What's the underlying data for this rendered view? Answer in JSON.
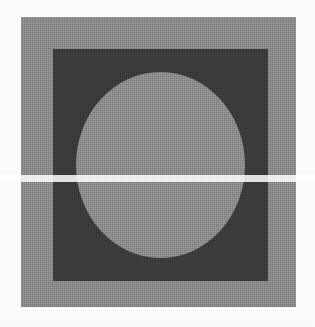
{
  "figure": {
    "caption": "",
    "media": "scanned halftone print",
    "canvas": {
      "width": 315,
      "height": 327,
      "background_color": "#fbfbfb"
    },
    "shapes": [
      {
        "name": "outer-square",
        "shape": "square",
        "fill_color": "#8b8b8b",
        "tone": "mid gray",
        "x": 21,
        "y": 17,
        "width": 275,
        "height": 290
      },
      {
        "name": "inner-square",
        "shape": "square",
        "fill_color": "#3b3b3b",
        "tone": "dark charcoal",
        "x": 53,
        "y": 49,
        "width": 215,
        "height": 232
      },
      {
        "name": "circle",
        "shape": "circle",
        "fill_color": "#8d8d8d",
        "tone": "light gray",
        "x": 76,
        "y": 72,
        "width": 169,
        "height": 186,
        "center_x": 160,
        "center_y": 165
      }
    ],
    "scan_artifacts": {
      "halftone_visible": true,
      "light_band_y": 175,
      "light_band_height": 7
    }
  }
}
